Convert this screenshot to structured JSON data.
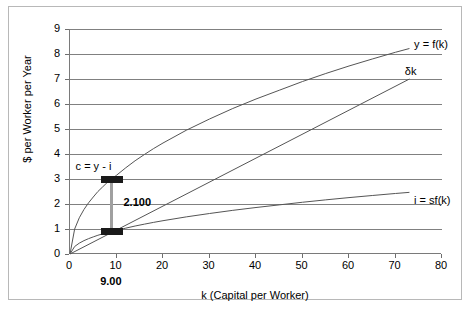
{
  "chart_data": {
    "type": "line",
    "title": "",
    "xlabel": "k (Capital per Worker)",
    "ylabel": "$ per Worker per Year",
    "xlim": [
      0,
      80
    ],
    "ylim": [
      0,
      9
    ],
    "xticks": [
      0,
      10,
      20,
      30,
      40,
      50,
      60,
      70,
      80
    ],
    "yticks": [
      0,
      1,
      2,
      3,
      4,
      5,
      6,
      7,
      8,
      9
    ],
    "grid": "horizontal",
    "legend": "inline-curve-labels",
    "series": [
      {
        "name": "y = f(k)",
        "label": "y = f(k)",
        "label_x": 74,
        "label_y": 8.35,
        "points": [
          [
            0,
            0
          ],
          [
            1,
            1.0
          ],
          [
            2,
            1.45
          ],
          [
            3,
            1.78
          ],
          [
            4,
            2.05
          ],
          [
            5,
            2.28
          ],
          [
            6,
            2.5
          ],
          [
            7,
            2.68
          ],
          [
            8,
            2.86
          ],
          [
            9,
            3.0
          ],
          [
            10,
            3.15
          ],
          [
            12,
            3.45
          ],
          [
            14,
            3.73
          ],
          [
            16,
            3.98
          ],
          [
            18,
            4.22
          ],
          [
            20,
            4.44
          ],
          [
            25,
            4.95
          ],
          [
            30,
            5.4
          ],
          [
            35,
            5.82
          ],
          [
            40,
            6.2
          ],
          [
            45,
            6.55
          ],
          [
            50,
            6.9
          ],
          [
            55,
            7.22
          ],
          [
            60,
            7.52
          ],
          [
            65,
            7.8
          ],
          [
            70,
            8.07
          ],
          [
            73,
            8.22
          ]
        ]
      },
      {
        "name": "δk",
        "label": "δk",
        "label_x": 72,
        "label_y": 7.3,
        "points": [
          [
            0,
            0
          ],
          [
            73,
            7.0
          ]
        ]
      },
      {
        "name": "i = sf(k)",
        "label": "i = sf(k)",
        "label_x": 74,
        "label_y": 2.12,
        "points": [
          [
            0,
            0
          ],
          [
            1,
            0.3
          ],
          [
            2,
            0.435
          ],
          [
            3,
            0.534
          ],
          [
            4,
            0.615
          ],
          [
            5,
            0.684
          ],
          [
            6,
            0.75
          ],
          [
            7,
            0.804
          ],
          [
            8,
            0.858
          ],
          [
            9,
            0.9
          ],
          [
            10,
            0.945
          ],
          [
            12,
            1.035
          ],
          [
            14,
            1.119
          ],
          [
            16,
            1.194
          ],
          [
            18,
            1.266
          ],
          [
            20,
            1.332
          ],
          [
            25,
            1.485
          ],
          [
            30,
            1.62
          ],
          [
            35,
            1.746
          ],
          [
            40,
            1.86
          ],
          [
            45,
            1.965
          ],
          [
            50,
            2.07
          ],
          [
            55,
            2.166
          ],
          [
            60,
            2.256
          ],
          [
            65,
            2.34
          ],
          [
            70,
            2.421
          ],
          [
            73,
            2.466
          ]
        ]
      }
    ],
    "annotations": {
      "consumption_label": "c = y - i",
      "consumption_label_x": 1.2,
      "consumption_label_y": 3.5,
      "gap_value": "2.100",
      "gap_value_x": 11.5,
      "gap_value_y": 2.05,
      "steady_state_label": "9.00",
      "steady_state_k": 9,
      "bar_top_y": 3.0,
      "bar_bottom_y": 0.9
    }
  }
}
